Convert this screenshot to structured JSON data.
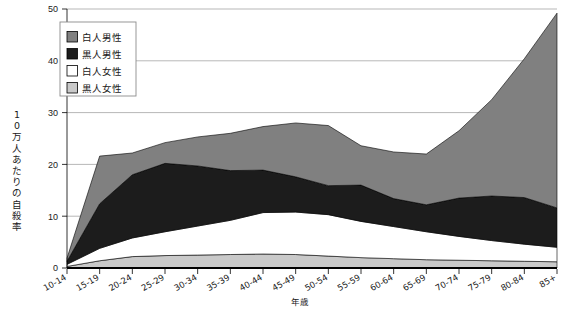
{
  "chart_data": {
    "type": "area",
    "stacked": true,
    "title": "",
    "xlabel": "年歳",
    "ylabel": "10万人あたりの自殺率",
    "ylim": [
      0,
      50
    ],
    "yticks": [
      0,
      10,
      20,
      30,
      40,
      50
    ],
    "grid": "horizontal",
    "legend_position": "top-left",
    "categories": [
      "10-14",
      "15-19",
      "20-24",
      "25-29",
      "30-34",
      "35-39",
      "40-44",
      "45-49",
      "50-54",
      "55-59",
      "60-64",
      "65-69",
      "70-74",
      "75-79",
      "80-84",
      "85+"
    ],
    "series": [
      {
        "name": "黒人女性",
        "color": "#c9c9c9",
        "stack_order": 1,
        "values": [
          0.3,
          1.4,
          2.2,
          2.4,
          2.5,
          2.6,
          2.7,
          2.6,
          2.3,
          2.0,
          1.8,
          1.6,
          1.5,
          1.4,
          1.3,
          1.2
        ]
      },
      {
        "name": "白人女性",
        "color": "#ffffff",
        "stack_order": 2,
        "values": [
          0.4,
          2.4,
          3.6,
          4.6,
          5.6,
          6.6,
          8.0,
          8.2,
          8.0,
          7.0,
          6.2,
          5.4,
          4.6,
          3.9,
          3.3,
          2.8
        ]
      },
      {
        "name": "黒人男性",
        "color": "#1c1c1c",
        "stack_order": 3,
        "values": [
          0.6,
          8.6,
          12.2,
          13.2,
          11.6,
          9.6,
          8.2,
          6.8,
          5.6,
          7.0,
          5.4,
          5.2,
          7.4,
          8.6,
          9.0,
          7.6
        ]
      },
      {
        "name": "白人男性",
        "color": "#808080",
        "stack_order": 4,
        "values": [
          0.6,
          9.2,
          4.2,
          4.0,
          5.6,
          7.2,
          8.4,
          10.4,
          11.6,
          7.6,
          9.0,
          9.8,
          13.0,
          18.6,
          26.8,
          37.6
        ]
      }
    ],
    "totals": [
      1.9,
      21.6,
      22.2,
      24.2,
      25.3,
      26.0,
      27.3,
      28.0,
      27.5,
      23.6,
      22.4,
      22.0,
      26.5,
      32.5,
      40.4,
      49.2
    ]
  },
  "legend": {
    "items": [
      {
        "label": "白人男性",
        "color": "#808080"
      },
      {
        "label": "黒人男性",
        "color": "#1c1c1c"
      },
      {
        "label": "白人女性",
        "color": "#ffffff"
      },
      {
        "label": "黒人女性",
        "color": "#c9c9c9"
      }
    ]
  },
  "axes": {
    "y_title": "10万人あたりの自殺率",
    "x_title": "年歳",
    "y_tick_labels": [
      "50",
      "40",
      "30",
      "20",
      "10",
      "0"
    ],
    "x_tick_labels": [
      "10-14",
      "15-19",
      "20-24",
      "25-29",
      "30-34",
      "35-39",
      "40-44",
      "45-49",
      "50-54",
      "55-59",
      "60-64",
      "65-69",
      "70-74",
      "75-79",
      "80-84",
      "85+"
    ]
  },
  "caption": {
    "text": ""
  }
}
